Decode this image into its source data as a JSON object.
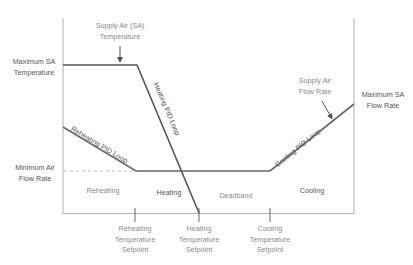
{
  "diagram": {
    "type": "VAV box control sequence",
    "colors": {
      "axis": "#aaaaaa",
      "sa_temperature_line": "#555555",
      "flow_rate_line": "#666666",
      "dashed_line": "#aaaaaa",
      "annotation_text": "#8a8a8a",
      "label_text": "#555555"
    },
    "annotations": {
      "sa_temperature": [
        "Supply Air (SA)",
        "Temperature"
      ],
      "sa_flow_rate": [
        "Supply Air",
        "Flow Rate"
      ]
    },
    "left_labels": {
      "max_sa_temperature": [
        "Maximum SA",
        "Temperature"
      ],
      "min_air_flow_rate": [
        "Minimum Air",
        "Flow Rate"
      ]
    },
    "right_labels": {
      "max_sa_flow_rate": [
        "Maximum SA",
        "Flow Rate"
      ]
    },
    "line_labels": {
      "heating_pid": "Heating PID Loop",
      "reheating_pid": "Reheating PID Loop",
      "cooling_pid": "Cooling PID Loop"
    },
    "zones": {
      "reheating": "Reheating",
      "heating": "Heating",
      "deadband": "Deadband",
      "cooling": "Cooling"
    },
    "setpoints": {
      "reheating": [
        "Reheating",
        "Temperature",
        "Setpoint"
      ],
      "heating": [
        "Heating",
        "Temperature",
        "Setpoint"
      ],
      "cooling": [
        "Cooling",
        "Temperature",
        "Setpoint"
      ]
    }
  }
}
